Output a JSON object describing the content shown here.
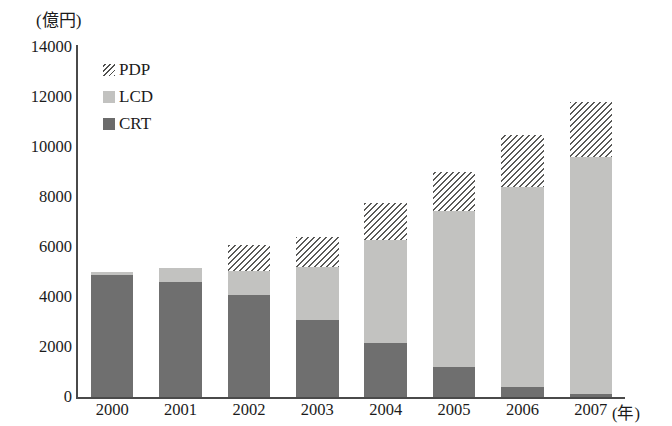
{
  "chart_data": {
    "type": "bar",
    "stacked": true,
    "title": "",
    "xlabel": "(年)",
    "ylabel": "(億円)",
    "categories": [
      "2000",
      "2001",
      "2002",
      "2003",
      "2004",
      "2005",
      "2006",
      "2007"
    ],
    "series": [
      {
        "name": "CRT",
        "color": "#6f6f6f",
        "values": [
          4900,
          4600,
          4100,
          3100,
          2150,
          1200,
          400,
          120
        ]
      },
      {
        "name": "LCD",
        "color": "#c2c2c0",
        "values": [
          100,
          550,
          950,
          2100,
          4150,
          6250,
          8000,
          9500
        ]
      },
      {
        "name": "PDP",
        "color": "hatch",
        "values": [
          0,
          0,
          1050,
          1200,
          1450,
          1550,
          2100,
          2200
        ]
      }
    ],
    "totals": [
      5000,
      5150,
      6100,
      6400,
      7750,
      9000,
      10500,
      11820
    ],
    "yticks": [
      0,
      2000,
      4000,
      6000,
      8000,
      10000,
      12000,
      14000
    ],
    "ytick_labels": [
      "0",
      "2000",
      "4000",
      "6000",
      "8000",
      "10000",
      "12000",
      "14000"
    ],
    "ylim": [
      0,
      14000
    ],
    "grid": false,
    "legend_position": "top-left",
    "legend": [
      {
        "label": "PDP",
        "swatch": "hatch-diagonal"
      },
      {
        "label": "LCD",
        "swatch": "light-gray"
      },
      {
        "label": "CRT",
        "swatch": "dark-gray"
      }
    ]
  },
  "axis": {
    "y_unit_label": "(億円)",
    "x_unit_label": "(年)"
  },
  "colors": {
    "crt": "#6f6f6f",
    "lcd": "#c2c2c0",
    "pdp_line": "#5a5a58",
    "axis": "#4a4a4a",
    "text": "#1b1b1b",
    "background": "#ffffff"
  }
}
